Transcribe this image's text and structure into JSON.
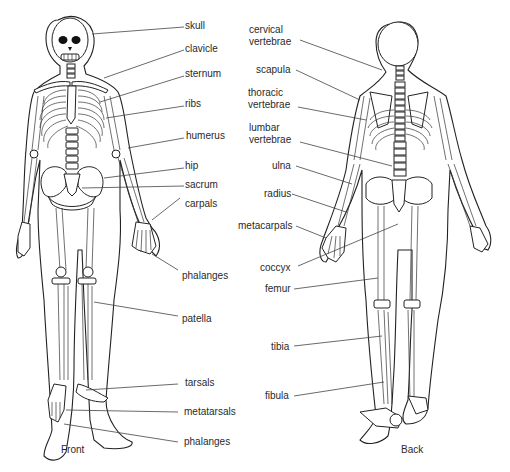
{
  "figure": {
    "front_caption": "Front",
    "back_caption": "Back"
  },
  "front_labels": [
    {
      "text": "skull"
    },
    {
      "text": "clavicle"
    },
    {
      "text": "sternum"
    },
    {
      "text": "ribs"
    },
    {
      "text": "humerus"
    },
    {
      "text": "hip"
    },
    {
      "text": "sacrum"
    },
    {
      "text": "carpals"
    },
    {
      "text": "phalanges"
    },
    {
      "text": "patella"
    },
    {
      "text": "tarsals"
    },
    {
      "text": "metatarsals"
    },
    {
      "text": "phalanges"
    }
  ],
  "back_labels": [
    {
      "line1": "cervical",
      "line2": "vertebrae"
    },
    {
      "text": "scapula"
    },
    {
      "line1": "thoracic",
      "line2": "vertebrae"
    },
    {
      "line1": "lumbar",
      "line2": "vertebrae"
    },
    {
      "text": "ulna"
    },
    {
      "text": "radius"
    },
    {
      "text": "metacarpals"
    },
    {
      "text": "coccyx"
    },
    {
      "text": "femur"
    },
    {
      "text": "tibia"
    },
    {
      "text": "fibula"
    }
  ]
}
